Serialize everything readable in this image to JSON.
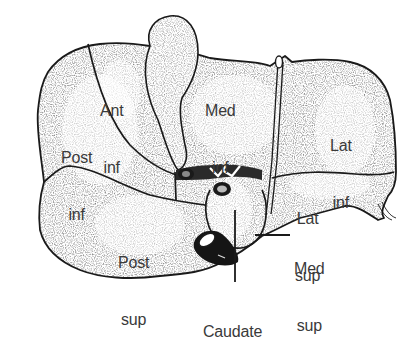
{
  "figure": {
    "line_color": "#1a1a1a",
    "stipple_color": "#555555",
    "label_color": "#3a3a3a",
    "background": "#ffffff"
  },
  "labels": {
    "ant_inf": {
      "line1": "Ant",
      "line2": "inf"
    },
    "med_inf": {
      "line1": "Med",
      "line2": "inf"
    },
    "post_inf": {
      "line1": "Post",
      "line2": "inf"
    },
    "lat_inf": {
      "line1": "Lat",
      "line2": "inf"
    },
    "lat_sup": {
      "line1": "Lat",
      "line2": "sup"
    },
    "post_sup": {
      "line1": "Post",
      "line2": "sup"
    },
    "med_sup": {
      "line1": "Med",
      "line2": "sup"
    },
    "caudate": {
      "line1": "Caudate"
    }
  }
}
